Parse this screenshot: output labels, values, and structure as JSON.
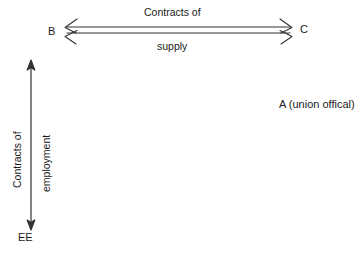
{
  "diagram": {
    "type": "relationship-diagram",
    "background_color": "#ffffff",
    "stroke_color": "#333333",
    "text_color": "#1a1a1a",
    "nodes": [
      {
        "id": "B",
        "label": "B",
        "x": 48,
        "y": 26
      },
      {
        "id": "C",
        "label": "C",
        "x": 300,
        "y": 24
      },
      {
        "id": "EE",
        "label": "EE",
        "x": 18,
        "y": 232
      },
      {
        "id": "A",
        "label": "A (union offical)",
        "x": 279,
        "y": 99
      }
    ],
    "edges": [
      {
        "id": "contracts-of-supply",
        "from": "B",
        "to": "C",
        "orientation": "horizontal",
        "style": "double-line-double-headed",
        "label_above": "Contracts of",
        "label_below": "supply",
        "x1": 65,
        "x2": 292,
        "y_top_line": 27,
        "y_bottom_line": 33
      },
      {
        "id": "contracts-of-employment",
        "from": "EE",
        "to": "B",
        "orientation": "vertical",
        "style": "single-line-double-headed",
        "label_outer": "Contracts of",
        "label_inner": "employment",
        "x": 31,
        "y1": 62,
        "y2": 228
      }
    ]
  }
}
